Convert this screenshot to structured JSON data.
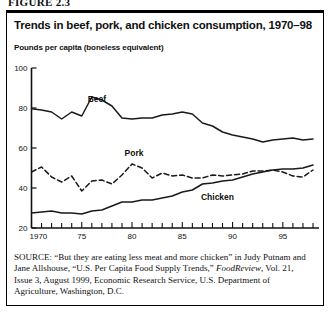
{
  "figure": {
    "label": "FIGURE 2.3"
  },
  "chart_title": "Trends in beef, pork, and chicken consumption, 1970–98",
  "y_axis_title": "Pounds per capita (boneless equivalent)",
  "source": {
    "label": "SOURCE:",
    "line1": " “But they are eating less meat and more chicken” in Judy",
    "line2": "Putnam and Jane Allshouse, “U.S. Per Capita Food Supply Trends,”",
    "line3_italic": "FoodReview",
    "line3_rest": ", Vol. 21, Issue 3, August 1999, Economic Research",
    "line4": "Service, U.S. Department of Agriculture, Washington, D.C."
  },
  "chart_data": {
    "type": "line",
    "title": "Trends in beef, pork, and chicken consumption, 1970–98",
    "xlabel": "",
    "ylabel": "Pounds per capita (boneless equivalent)",
    "xlim": [
      1970,
      1998
    ],
    "ylim": [
      20,
      100
    ],
    "ytick_labels": [
      "20",
      "40",
      "60",
      "80",
      "100"
    ],
    "ytick_values": [
      20,
      40,
      60,
      80,
      100
    ],
    "xtick_labels": [
      "1970",
      "75",
      "80",
      "85",
      "90",
      "95"
    ],
    "xtick_values": [
      1970,
      1975,
      1980,
      1985,
      1990,
      1995
    ],
    "xtick_minor_every": 1,
    "grid": false,
    "legend": "inline-labels",
    "x": [
      1970,
      1971,
      1972,
      1973,
      1974,
      1975,
      1976,
      1977,
      1978,
      1979,
      1980,
      1981,
      1982,
      1983,
      1984,
      1985,
      1986,
      1987,
      1988,
      1989,
      1990,
      1991,
      1992,
      1993,
      1994,
      1995,
      1996,
      1997,
      1998
    ],
    "series": [
      {
        "name": "Beef",
        "style": "solid",
        "color": "#1a1a1a",
        "label_x": 1976.5,
        "label_y": 83,
        "values": [
          79.6,
          79.0,
          78.0,
          74.5,
          78.0,
          76.0,
          85.5,
          84.0,
          81.0,
          75.0,
          74.5,
          75.0,
          75.0,
          76.5,
          77.0,
          78.0,
          77.0,
          72.5,
          71.0,
          68.0,
          66.5,
          65.5,
          64.5,
          63.0,
          64.0,
          64.5,
          65.0,
          64.0,
          64.5
        ]
      },
      {
        "name": "Pork",
        "style": "dashed",
        "color": "#1a1a1a",
        "label_x": 1980.2,
        "label_y": 56,
        "values": [
          48.0,
          50.5,
          45.5,
          43.0,
          46.0,
          38.5,
          43.5,
          44.0,
          42.0,
          46.5,
          52.0,
          50.0,
          45.0,
          47.5,
          46.0,
          46.5,
          45.0,
          45.0,
          46.5,
          46.0,
          46.5,
          47.0,
          48.5,
          48.5,
          49.0,
          48.0,
          46.0,
          45.5,
          49.0
        ]
      },
      {
        "name": "Chicken",
        "style": "solid",
        "color": "#1a1a1a",
        "label_x": 1988.5,
        "label_y": 34,
        "values": [
          27.5,
          28.0,
          28.5,
          27.5,
          27.5,
          27.0,
          28.5,
          29.0,
          31.0,
          33.0,
          33.0,
          34.0,
          34.0,
          35.0,
          36.0,
          38.0,
          39.0,
          42.0,
          42.5,
          43.5,
          44.0,
          45.5,
          47.0,
          48.0,
          49.0,
          49.5,
          49.5,
          50.0,
          51.5
        ]
      }
    ]
  }
}
